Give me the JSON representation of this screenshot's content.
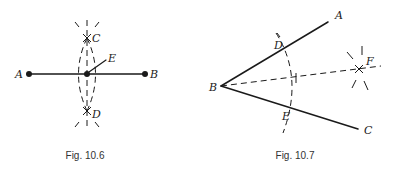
{
  "figures": [
    {
      "id": "fig-10-6",
      "caption": "Fig. 10.6",
      "description": "Perpendicular bisector of segment AB constructed with compass arcs meeting at C and D; E is midpoint",
      "points": {
        "A": {
          "label": "A",
          "x": 29,
          "y": 74
        },
        "B": {
          "label": "B",
          "x": 145,
          "y": 74
        },
        "C": {
          "label": "C",
          "x": 87,
          "y": 38
        },
        "D": {
          "label": "D",
          "x": 87,
          "y": 111
        },
        "E": {
          "label": "E",
          "x": 87,
          "y": 74
        }
      }
    },
    {
      "id": "fig-10-7",
      "caption": "Fig. 10.7",
      "description": "Angle ABC bisected; arc from B cuts BA at D and BC at E; arcs from D and E meet at F; BF is bisector",
      "points": {
        "A": {
          "label": "A",
          "x": 328,
          "y": 22
        },
        "B": {
          "label": "B",
          "x": 221,
          "y": 86
        },
        "C": {
          "label": "C",
          "x": 358,
          "y": 129
        },
        "D": {
          "label": "D",
          "x": 287,
          "y": 46
        },
        "E": {
          "label": "E",
          "x": 295,
          "y": 108
        },
        "F": {
          "label": "F",
          "x": 359,
          "y": 69
        }
      }
    }
  ]
}
